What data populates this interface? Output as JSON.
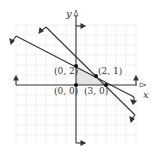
{
  "figure_label": "",
  "axes": {
    "x_label": "x",
    "y_label": "y",
    "origin_px": [
      76,
      85
    ],
    "unit_px": 10,
    "grid": true,
    "grid_color": "#e8e8e8",
    "axis_color": "#333333"
  },
  "lines": [
    {
      "name": "line-1",
      "equation": "x + 2y = 4",
      "color": "#333333"
    },
    {
      "name": "line-2",
      "equation": "x + y = 3",
      "color": "#333333"
    }
  ],
  "points": [
    {
      "label": "(0, 2)",
      "x": 0,
      "y": 2
    },
    {
      "label": "(2, 1)",
      "x": 2,
      "y": 1
    },
    {
      "label": "(0, 0)",
      "x": 0,
      "y": 0
    },
    {
      "label": "(3, 0)",
      "x": 3,
      "y": 0
    }
  ],
  "shaded_region": {
    "vertices": [
      [
        0,
        0
      ],
      [
        0,
        2
      ],
      [
        2,
        1
      ],
      [
        3,
        0
      ]
    ],
    "color": "#e6e6e6"
  }
}
